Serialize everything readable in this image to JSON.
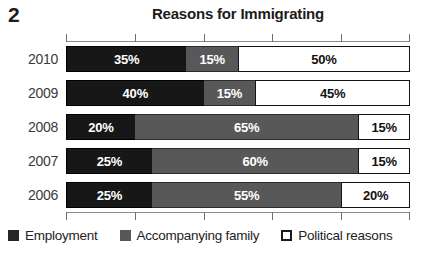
{
  "figure": {
    "number": "2"
  },
  "chart_data": {
    "type": "bar",
    "orientation": "horizontal",
    "stacked": true,
    "stack_total": 100,
    "title": "Reasons for Immigrating",
    "xlabel": "",
    "ylabel": "",
    "xlim": [
      0,
      100
    ],
    "xtick_labels": [
      "0%",
      "20%",
      "40%",
      "60%",
      "80%",
      "100%"
    ],
    "xticks": [
      0,
      20,
      40,
      60,
      80,
      100
    ],
    "xtick_labels_visible": false,
    "grid": false,
    "legend_position": "bottom-left",
    "categories": [
      "2010",
      "2009",
      "2008",
      "2007",
      "2006"
    ],
    "series": [
      {
        "name": "Employment",
        "color": "#171717",
        "values": [
          35,
          40,
          20,
          25,
          25
        ],
        "data_labels": [
          "35%",
          "40%",
          "20%",
          "25%",
          "25%"
        ]
      },
      {
        "name": "Accompanying family",
        "color": "#585858",
        "values": [
          15,
          15,
          65,
          60,
          55
        ],
        "data_labels": [
          "15%",
          "15%",
          "65%",
          "60%",
          "55%"
        ]
      },
      {
        "name": "Political reasons",
        "color": "#ffffff",
        "values": [
          50,
          45,
          15,
          15,
          20
        ],
        "data_labels": [
          "50%",
          "45%",
          "15%",
          "15%",
          "20%"
        ]
      }
    ]
  },
  "legend": {
    "items": [
      {
        "label": "Employment",
        "swatch": "employment"
      },
      {
        "label": "Accompanying family",
        "swatch": "family"
      },
      {
        "label": "Political reasons",
        "swatch": "political"
      }
    ]
  }
}
